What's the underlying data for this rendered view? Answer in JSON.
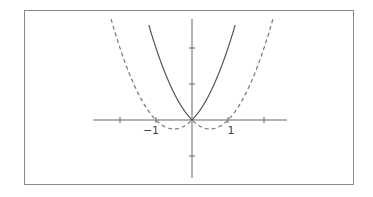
{
  "chart_data": {
    "type": "line",
    "title": "",
    "xlabel": "",
    "ylabel": "",
    "xlim": [
      -2.7,
      2.65
    ],
    "ylim": [
      -1.6,
      2.8
    ],
    "grid": false,
    "legend": null,
    "x_ticks": [
      -2,
      -1,
      1,
      2
    ],
    "x_tick_labels": [
      {
        "value": -1,
        "label": "−1"
      },
      {
        "value": 1,
        "label": "1"
      }
    ],
    "y_ticks": [
      -1,
      1,
      2
    ],
    "series": [
      {
        "name": "solid curve",
        "style": "solid",
        "color": "#555555",
        "expression": "x^2 + |x|",
        "x": [
          -1.2,
          -1.0,
          -0.75,
          -0.5,
          -0.25,
          0,
          0.25,
          0.5,
          0.75,
          1.0,
          1.2
        ],
        "y": [
          2.64,
          2.0,
          1.31,
          0.75,
          0.31,
          0,
          0.31,
          0.75,
          1.31,
          2.0,
          2.64
        ]
      },
      {
        "name": "dashed curve",
        "style": "dashed",
        "color": "#777777",
        "expression": "x^2 - |x|",
        "x": [
          -2.3,
          -2.0,
          -1.5,
          -1.0,
          -0.75,
          -0.5,
          -0.25,
          0,
          0.25,
          0.5,
          0.75,
          1.0,
          1.5,
          2.0,
          2.3
        ],
        "y": [
          2.99,
          2.0,
          0.75,
          0,
          -0.19,
          -0.25,
          -0.19,
          0,
          -0.19,
          -0.25,
          -0.19,
          0,
          0.75,
          2.0,
          2.99
        ]
      }
    ]
  },
  "layout": {
    "origin_px": [
      192,
      120
    ],
    "unit_px": 36,
    "x_axis_px": [
      93,
      287
    ],
    "y_axis_px": [
      19,
      178
    ]
  }
}
